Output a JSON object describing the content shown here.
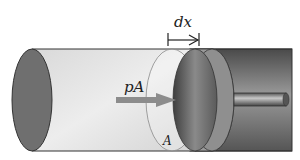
{
  "diagram": {
    "labels": {
      "displacement": "dx",
      "force": "pA",
      "area": "A"
    },
    "colors": {
      "gas": "#e6e6e6",
      "end_cap": "#6f6f6f",
      "cylinder_dark": "#7a7a7a",
      "piston": "#5e5e5e",
      "arrow": "#8c8c8c",
      "outline": "#333333"
    }
  }
}
